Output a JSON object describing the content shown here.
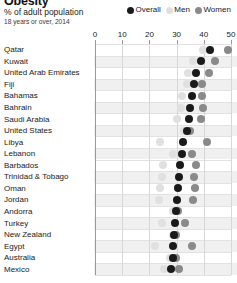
{
  "header": {
    "title": "Obesity",
    "subtitle": "% of adult population",
    "subtitle2": "18 years or over, 2014"
  },
  "legend": {
    "items": [
      {
        "label": "Overall",
        "color": "#1a1a1a",
        "key": "overall"
      },
      {
        "label": "Men",
        "color": "#e0e0e0",
        "key": "men"
      },
      {
        "label": "Women",
        "color": "#8a8a8a",
        "key": "women"
      }
    ]
  },
  "colors": {
    "overall": "#1a1a1a",
    "men": "#e0e0e0",
    "women": "#8a8a8a",
    "grid": "#d7d7d7",
    "band": "#f0f0f0",
    "axis": "#9a9a9a"
  },
  "chart_data": {
    "type": "scatter",
    "title": "Obesity",
    "subtitle": "% of adult population",
    "note": "18 years or over, 2014",
    "xlabel": "",
    "ylabel": "",
    "xlim": [
      0,
      50
    ],
    "xticks": [
      0,
      10,
      20,
      30,
      40,
      50
    ],
    "grid": true,
    "legend_position": "top-right",
    "categories": [
      "Qatar",
      "Kuwait",
      "United Arab Emirates",
      "Fiji",
      "Bahamas",
      "Bahrain",
      "Saudi Arabia",
      "United States",
      "Libya",
      "Lebanon",
      "Barbados",
      "Trinidad & Tobago",
      "Oman",
      "Jordan",
      "Andorra",
      "Turkey",
      "New Zealand",
      "Egypt",
      "Australia",
      "Mexico"
    ],
    "series": [
      {
        "name": "Overall",
        "key": "overall",
        "color": "#1a1a1a",
        "values": [
          42.3,
          39.0,
          37.2,
          36.4,
          35.8,
          35.1,
          34.6,
          33.7,
          32.5,
          32.0,
          31.3,
          30.8,
          30.4,
          30.0,
          29.6,
          29.4,
          29.1,
          28.8,
          28.6,
          28.1
        ]
      },
      {
        "name": "Men",
        "key": "men",
        "color": "#e0e0e0",
        "values": [
          39.8,
          36.0,
          34.2,
          33.8,
          32.0,
          31.5,
          30.2,
          32.8,
          24.0,
          28.5,
          25.0,
          24.5,
          24.0,
          23.5,
          28.8,
          24.5,
          28.5,
          22.0,
          27.6,
          25.2
        ]
      },
      {
        "name": "Women",
        "key": "women",
        "color": "#8a8a8a",
        "values": [
          49.0,
          44.2,
          42.0,
          39.2,
          39.5,
          39.6,
          39.0,
          34.8,
          41.0,
          35.5,
          37.2,
          36.5,
          36.8,
          36.2,
          30.4,
          33.2,
          29.6,
          35.5,
          29.6,
          31.0
        ]
      }
    ]
  }
}
